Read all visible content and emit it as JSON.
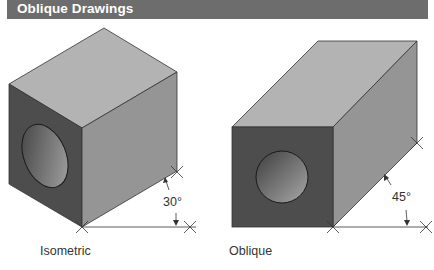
{
  "header": {
    "title": "Oblique Drawings"
  },
  "figures": [
    {
      "id": "isometric",
      "caption": "Isometric",
      "angle_label": "30°",
      "faces": {
        "top": "#b3b3b3",
        "left": "#4d4d4d",
        "right": "#959595"
      },
      "hole": "ellipse on left face"
    },
    {
      "id": "oblique",
      "caption": "Oblique",
      "angle_label": "45°",
      "faces": {
        "top": "#b3b3b3",
        "front": "#4d4d4d",
        "side": "#959595"
      },
      "hole": "circle on front face"
    }
  ],
  "colors": {
    "header_bg": "#6d6d6d",
    "header_text": "#ffffff",
    "line": "#333333"
  }
}
